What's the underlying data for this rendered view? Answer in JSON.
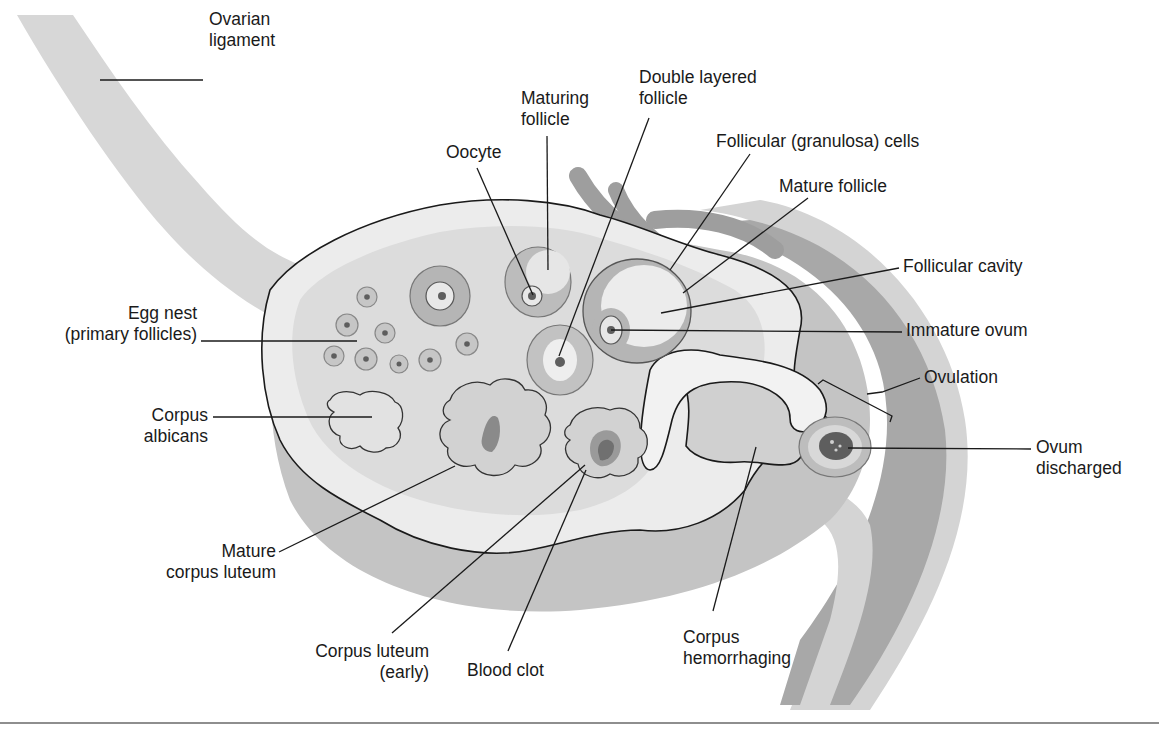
{
  "figure": {
    "palette": {
      "background": "#ffffff",
      "ligament": "#d7d7d7",
      "ovary_outer": "#c4c4c4",
      "cortex_light": "#ececec",
      "stroma": "#dcdcdc",
      "vessel_dark": "#9e9e9e",
      "tube_dark": "#a8a8a8",
      "tube_light": "#d4d4d4",
      "follicle_ring": "#b8b8b8",
      "nucleus": "#5e5e5e",
      "clot": "#707070",
      "text": "#1a1a1a",
      "rule": "#8e8e8e"
    },
    "labels": [
      {
        "id": "ovarian-ligament",
        "lines": [
          "Ovarian",
          "ligament"
        ],
        "x": 209,
        "y": 25,
        "anchor": "start"
      },
      {
        "id": "oocyte",
        "lines": [
          "Oocyte"
        ],
        "x": 446,
        "y": 158,
        "anchor": "start"
      },
      {
        "id": "maturing-follicle",
        "lines": [
          "Maturing",
          "follicle"
        ],
        "x": 521,
        "y": 104,
        "anchor": "start"
      },
      {
        "id": "double-layered-follicle",
        "lines": [
          "Double layered",
          "follicle"
        ],
        "x": 639,
        "y": 83,
        "anchor": "start"
      },
      {
        "id": "follicular-granulosa-cells",
        "lines": [
          "Follicular (granulosa) cells"
        ],
        "x": 716,
        "y": 147,
        "anchor": "start"
      },
      {
        "id": "mature-follicle",
        "lines": [
          "Mature follicle"
        ],
        "x": 779,
        "y": 192,
        "anchor": "start"
      },
      {
        "id": "follicular-cavity",
        "lines": [
          "Follicular cavity"
        ],
        "x": 903,
        "y": 272,
        "anchor": "start"
      },
      {
        "id": "immature-ovum",
        "lines": [
          "Immature ovum"
        ],
        "x": 906,
        "y": 336,
        "anchor": "start"
      },
      {
        "id": "ovulation",
        "lines": [
          "Ovulation"
        ],
        "x": 924,
        "y": 383,
        "anchor": "start"
      },
      {
        "id": "ovum-discharged",
        "lines": [
          "Ovum",
          "discharged"
        ],
        "x": 1036,
        "y": 453,
        "anchor": "start"
      },
      {
        "id": "egg-nest",
        "lines": [
          "Egg nest",
          "(primary follicles)"
        ],
        "x": 197,
        "y": 319,
        "anchor": "end"
      },
      {
        "id": "corpus-albicans",
        "lines": [
          "Corpus",
          "albicans"
        ],
        "x": 208,
        "y": 421,
        "anchor": "end"
      },
      {
        "id": "mature-corpus-luteum",
        "lines": [
          "Mature",
          "corpus luteum"
        ],
        "x": 276,
        "y": 557,
        "anchor": "end"
      },
      {
        "id": "corpus-luteum-early",
        "lines": [
          "Corpus luteum",
          "(early)"
        ],
        "x": 429,
        "y": 657,
        "anchor": "end"
      },
      {
        "id": "blood-clot",
        "lines": [
          "Blood clot"
        ],
        "x": 467,
        "y": 676,
        "anchor": "start"
      },
      {
        "id": "corpus-hemorrhaging",
        "lines": [
          "Corpus",
          "hemorrhaging"
        ],
        "x": 683,
        "y": 643,
        "anchor": "start"
      }
    ],
    "leaders": [
      {
        "id": "ovarian-ligament",
        "points": [
          [
            100,
            80
          ],
          [
            203,
            80
          ]
        ]
      },
      {
        "id": "oocyte",
        "points": [
          [
            477,
            168
          ],
          [
            533,
            295
          ]
        ]
      },
      {
        "id": "maturing-follicle",
        "points": [
          [
            547,
            136
          ],
          [
            548,
            270
          ]
        ]
      },
      {
        "id": "double-layered-follicle",
        "points": [
          [
            649,
            118
          ],
          [
            559,
            356
          ]
        ]
      },
      {
        "id": "follicular-granulosa-cells",
        "points": [
          [
            750,
            154
          ],
          [
            670,
            270
          ]
        ]
      },
      {
        "id": "mature-follicle",
        "points": [
          [
            808,
            198
          ],
          [
            683,
            293
          ]
        ]
      },
      {
        "id": "follicular-cavity",
        "points": [
          [
            899,
            268
          ],
          [
            661,
            313
          ]
        ]
      },
      {
        "id": "immature-ovum",
        "points": [
          [
            902,
            332
          ],
          [
            611,
            330
          ]
        ]
      },
      {
        "id": "ovulation",
        "points": [
          [
            920,
            378
          ],
          [
            882,
            392
          ],
          [
            867,
            394
          ]
        ]
      },
      {
        "id": "ovum-discharged",
        "points": [
          [
            1031,
            449
          ],
          [
            848,
            448
          ]
        ]
      },
      {
        "id": "egg-nest",
        "points": [
          [
            201,
            341
          ],
          [
            357,
            341
          ]
        ]
      },
      {
        "id": "corpus-albicans",
        "points": [
          [
            213,
            417
          ],
          [
            372,
            417
          ]
        ]
      },
      {
        "id": "mature-corpus-luteum",
        "points": [
          [
            279,
            552
          ],
          [
            455,
            466
          ]
        ]
      },
      {
        "id": "corpus-luteum-early",
        "points": [
          [
            392,
            633
          ],
          [
            585,
            465
          ]
        ]
      },
      {
        "id": "blood-clot",
        "points": [
          [
            508,
            651
          ],
          [
            586,
            470
          ]
        ]
      },
      {
        "id": "corpus-hemorrhaging",
        "points": [
          [
            713,
            611
          ],
          [
            756,
            447
          ]
        ]
      }
    ]
  }
}
